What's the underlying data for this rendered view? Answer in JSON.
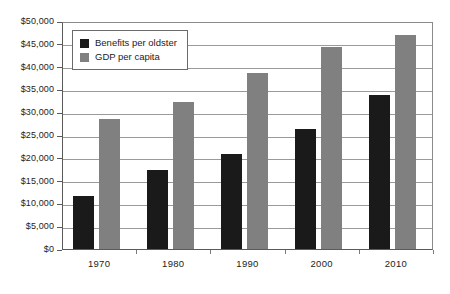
{
  "chart_data": {
    "type": "bar",
    "title": "",
    "subtitle": "",
    "xlabel": "",
    "ylabel": "",
    "categories": [
      "1970",
      "1980",
      "1990",
      "2000",
      "2010"
    ],
    "series": [
      {
        "name": "Benefits per oldster",
        "color": "#1a1a1a",
        "values": [
          11700,
          17300,
          20800,
          26300,
          33800
        ]
      },
      {
        "name": "GDP per capita",
        "color": "#808080",
        "values": [
          28500,
          32200,
          38600,
          44300,
          47000
        ]
      }
    ],
    "ylim": [
      0,
      50000
    ],
    "ytick_values": [
      0,
      5000,
      10000,
      15000,
      20000,
      25000,
      30000,
      35000,
      40000,
      45000,
      50000
    ],
    "ytick_labels": [
      "$0",
      "$5,000",
      "$10,000",
      "$15,000",
      "$20,000",
      "$25,000",
      "$30,000",
      "$35,000",
      "$40,000",
      "$45,000",
      "$50,000"
    ],
    "grid": true,
    "grid_axis": "y",
    "legend_position": "top-left",
    "legend_entries": [
      "Benefits per oldster",
      "GDP per capita"
    ],
    "annotations": []
  }
}
